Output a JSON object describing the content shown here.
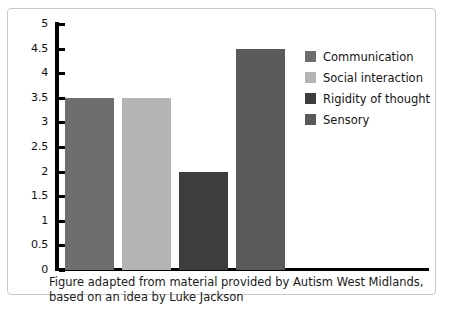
{
  "figure": {
    "caption_line_1": "Figure adapted from material provided by Autism West Midlands,",
    "caption_line_2": "based on an idea by Luke Jackson",
    "border_color": "#c8c8c8",
    "background": "#ffffff"
  },
  "legend": {
    "position": "right",
    "items": [
      {
        "label": "Communication",
        "color": "#6e6e6e"
      },
      {
        "label": "Social interaction",
        "color": "#b4b4b4"
      },
      {
        "label": "Rigidity of thought",
        "color": "#3d3d3d"
      },
      {
        "label": "Sensory",
        "color": "#5a5a5a"
      }
    ]
  },
  "chart_data": {
    "type": "bar",
    "title": "",
    "xlabel": "",
    "ylabel": "",
    "categories": [
      "Communication",
      "Social interaction",
      "Rigidity of thought",
      "Sensory"
    ],
    "values": [
      3.5,
      3.5,
      2,
      4.5
    ],
    "colors": [
      "#6e6e6e",
      "#b4b4b4",
      "#3d3d3d",
      "#5a5a5a"
    ],
    "ylim": [
      0,
      5
    ],
    "ytick_step": 0.5,
    "ytick_labels": [
      "5",
      "4.5",
      "4",
      "3.5",
      "3",
      "2.5",
      "2",
      "1.5",
      "1",
      "0.5",
      "0"
    ],
    "ytick_values": [
      5,
      4.5,
      4,
      3.5,
      3,
      2.5,
      2,
      1.5,
      1,
      0.5,
      0
    ],
    "grid": false,
    "xtick_labels": []
  }
}
